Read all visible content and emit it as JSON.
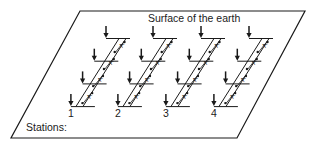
{
  "diagram": {
    "title": "Surface of the earth",
    "stations_label": "Stations:",
    "stations": [
      {
        "number": "1",
        "x_offset": 0
      },
      {
        "number": "2",
        "x_offset": 47
      },
      {
        "number": "3",
        "x_offset": 95
      },
      {
        "number": "4",
        "x_offset": 143
      }
    ],
    "segment_label": "A",
    "arrows_per_station": 4,
    "colors": {
      "line": "#1a1a1a",
      "background": "#ffffff"
    }
  }
}
